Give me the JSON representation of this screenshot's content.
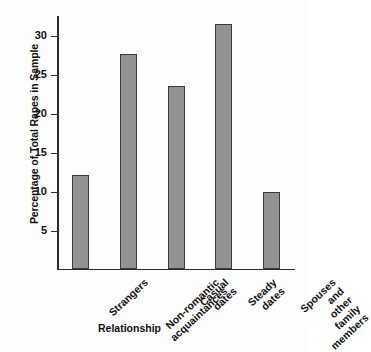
{
  "chart_data": {
    "type": "bar",
    "title": "",
    "xlabel": "Relationship",
    "ylabel": "Percentage of Total Rapes in Sample",
    "categories": [
      "Strangers",
      "Non-romantic\nacquaintances",
      "Casual\ndates",
      "Steady\ndates",
      "Spouses\nand other\nfamily\nmembers"
    ],
    "values": [
      12.0,
      27.4,
      23.4,
      31.3,
      9.8
    ],
    "ylim": [
      0,
      32.5
    ],
    "yticks": [
      5,
      10,
      15,
      20,
      25,
      30
    ],
    "ytick_labels": [
      "5",
      "10",
      "15",
      "20",
      "25",
      "30"
    ],
    "grid": false,
    "legend": false,
    "bar_color": "#929292",
    "bar_edge_color": "#3a3a3a",
    "axis_color": "#2b2b2b",
    "background_color": "#fdfdfd"
  }
}
